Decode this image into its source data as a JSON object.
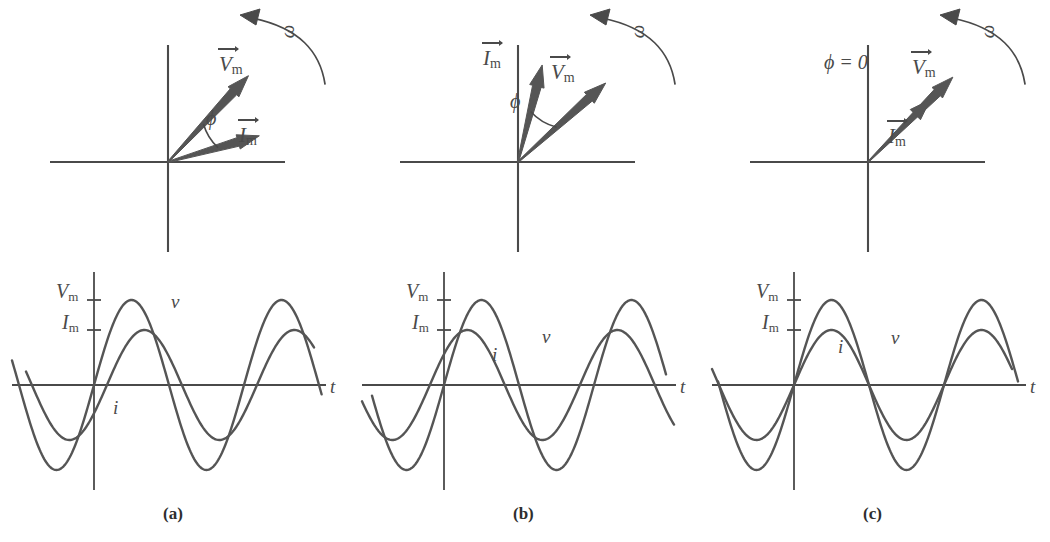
{
  "figure": {
    "stroke_color": "#555555",
    "axis_color": "#4a4a4a",
    "background": "#ffffff"
  },
  "panels": [
    {
      "id": "a",
      "caption": "(a)",
      "phasor": {
        "omega_label": "ω",
        "phi_label": "ϕ",
        "voltage_label": "V",
        "voltage_sub": "m",
        "current_label": "I",
        "current_sub": "m",
        "voltage_angle_deg": 47,
        "current_angle_deg": 16,
        "phi_value_deg": 31,
        "voltage_length": 118,
        "current_length": 95
      },
      "wave": {
        "t_label": "t",
        "vm_label": "V",
        "vm_sub": "m",
        "im_label": "I",
        "im_sub": "m",
        "v_curve_label": "v",
        "i_curve_label": "i",
        "v_amplitude": 85,
        "i_amplitude": 55,
        "v_phase_deg": 0,
        "i_phase_deg": -31
      }
    },
    {
      "id": "b",
      "caption": "(b)",
      "phasor": {
        "omega_label": "ω",
        "phi_label": "ϕ",
        "voltage_label": "V",
        "voltage_sub": "m",
        "current_label": "I",
        "current_sub": "m",
        "voltage_angle_deg": 42,
        "current_angle_deg": 76,
        "phi_value_deg": 34,
        "voltage_length": 118,
        "current_length": 100
      },
      "wave": {
        "t_label": "t",
        "vm_label": "V",
        "vm_sub": "m",
        "im_label": "I",
        "im_sub": "m",
        "v_curve_label": "v",
        "i_curve_label": "i",
        "v_amplitude": 85,
        "i_amplitude": 55,
        "v_phase_deg": 0,
        "i_phase_deg": 34
      }
    },
    {
      "id": "c",
      "caption": "(c)",
      "phasor": {
        "omega_label": "ω",
        "phi_label": "ϕ = 0",
        "voltage_label": "V",
        "voltage_sub": "m",
        "current_label": "I",
        "current_sub": "m",
        "voltage_angle_deg": 45,
        "current_angle_deg": 45,
        "phi_value_deg": 0,
        "voltage_length": 120,
        "current_length": 88
      },
      "wave": {
        "t_label": "t",
        "vm_label": "V",
        "vm_sub": "m",
        "im_label": "I",
        "im_sub": "m",
        "v_curve_label": "v",
        "i_curve_label": "i",
        "v_amplitude": 85,
        "i_amplitude": 55,
        "v_phase_deg": 0,
        "i_phase_deg": 0
      }
    }
  ],
  "chart_data": {
    "type": "line",
    "xlabel": "t",
    "ylabel": "",
    "grid": false,
    "legend": "inline curve labels",
    "ytick_labels": [
      "V_m",
      "I_m"
    ],
    "ytick_values": [
      85,
      55
    ],
    "subplots": [
      {
        "panel": "(a)",
        "description": "Voltage leads current by phase angle phi",
        "series": [
          {
            "name": "v",
            "amplitude": 85,
            "phase_deg": 0,
            "form": "V_m sin(wt)"
          },
          {
            "name": "i",
            "amplitude": 55,
            "phase_deg": -31,
            "form": "I_m sin(wt - phi)"
          }
        ]
      },
      {
        "panel": "(b)",
        "description": "Current leads voltage by phase angle phi",
        "series": [
          {
            "name": "v",
            "amplitude": 85,
            "phase_deg": 0,
            "form": "V_m sin(wt)"
          },
          {
            "name": "i",
            "amplitude": 55,
            "phase_deg": 34,
            "form": "I_m sin(wt + phi)"
          }
        ]
      },
      {
        "panel": "(c)",
        "description": "Voltage and current in phase, phi = 0",
        "series": [
          {
            "name": "v",
            "amplitude": 85,
            "phase_deg": 0,
            "form": "V_m sin(wt)"
          },
          {
            "name": "i",
            "amplitude": 55,
            "phase_deg": 0,
            "form": "I_m sin(wt)"
          }
        ]
      }
    ]
  }
}
